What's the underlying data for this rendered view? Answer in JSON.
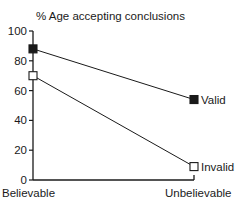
{
  "chart_data": {
    "type": "line",
    "title": "% Age accepting conclusions",
    "xlabel": "",
    "ylabel": "% Age accepting conclusions",
    "categories": [
      "Believable",
      "Unbelievable"
    ],
    "series": [
      {
        "name": "Valid",
        "values": [
          88,
          54
        ],
        "marker": "filled-square",
        "color": "#1a1a1a"
      },
      {
        "name": "Invalid",
        "values": [
          70,
          9
        ],
        "marker": "open-square",
        "color": "#1a1a1a"
      }
    ],
    "ylim": [
      0,
      100
    ],
    "yticks": [
      "0",
      "20",
      "40",
      "60",
      "80",
      "100"
    ],
    "grid": false,
    "legend": "inline labels at line ends"
  }
}
